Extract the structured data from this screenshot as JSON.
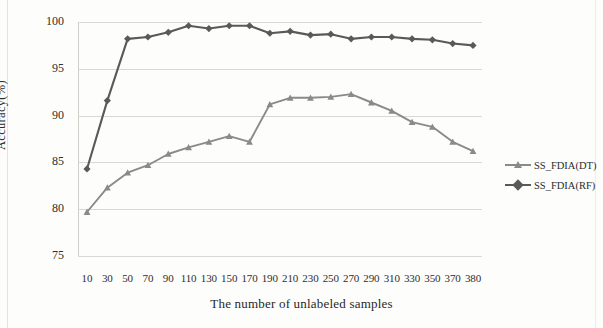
{
  "chart_data": {
    "type": "line",
    "title": "",
    "xlabel": "The number of unlabeled samples",
    "ylabel": "Accuracy(%)",
    "categories": [
      10,
      30,
      50,
      70,
      90,
      110,
      130,
      150,
      170,
      190,
      210,
      230,
      250,
      270,
      290,
      310,
      330,
      350,
      370,
      380
    ],
    "xticklabels": [
      "10",
      "30",
      "50",
      "70",
      "90",
      "110",
      "130",
      "150",
      "170",
      "190",
      "210",
      "230",
      "250",
      "270",
      "290",
      "310",
      "330",
      "350",
      "370",
      "380"
    ],
    "yticklabels": [
      "75",
      "80",
      "85",
      "90",
      "95",
      "100"
    ],
    "yticks": [
      75,
      80,
      85,
      90,
      95,
      100
    ],
    "ylim": [
      75,
      100
    ],
    "grid": "horizontal",
    "legend_position": "right",
    "series": [
      {
        "name": "SS_FDIA(DT)",
        "color": "#8a8a8a",
        "marker": "triangle",
        "values": [
          79.7,
          82.3,
          83.9,
          84.7,
          85.9,
          86.6,
          87.2,
          87.8,
          87.2,
          91.2,
          91.9,
          91.9,
          92.0,
          92.3,
          91.4,
          90.5,
          89.3,
          88.8,
          87.2,
          86.2
        ]
      },
      {
        "name": "SS_FDIA(RF)",
        "color": "#595959",
        "marker": "diamond",
        "values": [
          84.3,
          91.6,
          98.2,
          98.4,
          98.9,
          99.6,
          99.3,
          99.6,
          99.6,
          98.8,
          99.0,
          98.6,
          98.7,
          98.2,
          98.4,
          98.4,
          98.2,
          98.1,
          97.7,
          97.5
        ]
      }
    ]
  },
  "legend": {
    "items": [
      {
        "label": "SS_FDIA(DT)"
      },
      {
        "label": "SS_FDIA(RF)"
      }
    ]
  },
  "axes": {
    "y_title": "Accuracy(%)",
    "x_title": "The number of unlabeled samples"
  }
}
